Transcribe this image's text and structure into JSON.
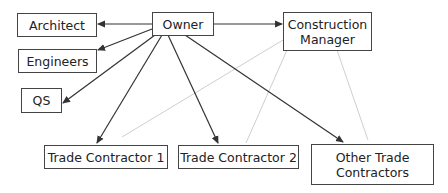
{
  "diagram": {
    "nodes": {
      "owner": {
        "label": "Owner"
      },
      "construction_manager": {
        "label": "Construction\nManager"
      },
      "architect": {
        "label": "Architect"
      },
      "engineers": {
        "label": "Engineers"
      },
      "qs": {
        "label": "QS"
      },
      "trade_contractor_1": {
        "label": "Trade Contractor 1"
      },
      "trade_contractor_2": {
        "label": "Trade Contractor 2"
      },
      "other_trade_contractors": {
        "label": "Other Trade\nContractors"
      }
    },
    "edges": [
      {
        "from": "owner",
        "to": "architect",
        "style": "contract"
      },
      {
        "from": "owner",
        "to": "engineers",
        "style": "contract"
      },
      {
        "from": "owner",
        "to": "qs",
        "style": "contract"
      },
      {
        "from": "owner",
        "to": "trade_contractor_1",
        "style": "contract"
      },
      {
        "from": "owner",
        "to": "trade_contractor_2",
        "style": "contract"
      },
      {
        "from": "owner",
        "to": "other_trade_contractors",
        "style": "contract"
      },
      {
        "from": "owner",
        "to": "construction_manager",
        "style": "contract"
      },
      {
        "from": "construction_manager",
        "to": "trade_contractor_1",
        "style": "coordination"
      },
      {
        "from": "construction_manager",
        "to": "trade_contractor_2",
        "style": "coordination"
      },
      {
        "from": "construction_manager",
        "to": "other_trade_contractors",
        "style": "coordination"
      }
    ],
    "colors": {
      "contract": "#333333",
      "coordination": "#cfcfcf"
    }
  }
}
